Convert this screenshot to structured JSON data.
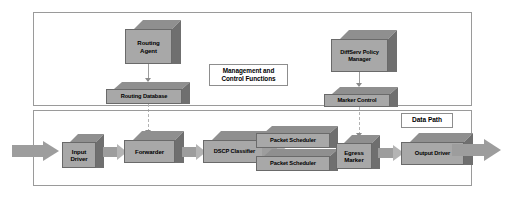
{
  "diagram": {
    "panels": [
      {
        "id": "management",
        "caption": "Management and\nControl Functions",
        "caption_line1": "Management and",
        "caption_line2": "Control Functions"
      },
      {
        "id": "data",
        "caption": "Data Path"
      }
    ],
    "colors": {
      "box_front": "#a8a8a8",
      "box_top": "#8f8f8f",
      "box_side": "#6f6f6f",
      "arrow": "#9d9d9d",
      "arrow_light": "#b4b4b4",
      "panel_border": "#9a9a9a",
      "caption_bg": "#ffffff"
    },
    "management_nodes": [
      {
        "id": "routing-agent",
        "label_line1": "Routing",
        "label_line2": "Agent"
      },
      {
        "id": "routing-database",
        "label_line1": "Routing Database",
        "label_line2": ""
      },
      {
        "id": "diffserv-policy-manager",
        "label_line1": "DiffServ Policy",
        "label_line2": "Manager"
      },
      {
        "id": "marker-control",
        "label_line1": "Marker Control",
        "label_line2": ""
      }
    ],
    "datapath_nodes": [
      {
        "id": "input-driver",
        "label_line1": "Input",
        "label_line2": "Driver"
      },
      {
        "id": "forwarder",
        "label_line1": "Forwarder",
        "label_line2": ""
      },
      {
        "id": "dscp-classifier",
        "label_line1": "DSCP Classifier",
        "label_line2": ""
      },
      {
        "id": "packet-scheduler-1",
        "label_line1": "Packet Scheduler",
        "label_line2": ""
      },
      {
        "id": "packet-scheduler-2",
        "label_line1": "Packet Scheduler",
        "label_line2": ""
      },
      {
        "id": "egress-marker",
        "label_line1": "Egress",
        "label_line2": "Marker"
      },
      {
        "id": "output-driver",
        "label_line1": "Output Driver",
        "label_line2": ""
      }
    ],
    "connections": [
      {
        "id": "routing-agent-to-routing-database",
        "type": "solid-arrow",
        "from": "routing-agent",
        "to": "routing-database"
      },
      {
        "id": "diffserv-policy-manager-to-marker-control",
        "type": "solid-arrow",
        "from": "diffserv-policy-manager",
        "to": "marker-control"
      },
      {
        "id": "routing-database-to-forwarder",
        "type": "dashed-arrow",
        "from": "routing-database",
        "to": "forwarder"
      },
      {
        "id": "marker-control-to-egress-marker",
        "type": "dashed-arrow",
        "from": "marker-control",
        "to": "egress-marker"
      },
      {
        "id": "ingress-flow",
        "type": "block-arrow",
        "from": "external",
        "to": "input-driver"
      },
      {
        "id": "input-driver-to-forwarder",
        "type": "block-arrow",
        "from": "input-driver",
        "to": "forwarder"
      },
      {
        "id": "forwarder-to-dscp-classifier",
        "type": "block-arrow",
        "from": "forwarder",
        "to": "dscp-classifier"
      },
      {
        "id": "dscp-classifier-to-packet-scheduler",
        "type": "block-arrow",
        "from": "dscp-classifier",
        "to": "packet-scheduler-1"
      },
      {
        "id": "packet-scheduler-to-egress-marker",
        "type": "block-arrow",
        "from": "packet-scheduler-1",
        "to": "egress-marker"
      },
      {
        "id": "egress-marker-to-output-driver",
        "type": "block-arrow",
        "from": "egress-marker",
        "to": "output-driver"
      },
      {
        "id": "egress-flow",
        "type": "block-arrow",
        "from": "output-driver",
        "to": "external"
      }
    ]
  }
}
